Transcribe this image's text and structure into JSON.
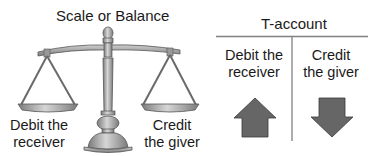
{
  "scale": {
    "title": "Scale or Balance",
    "left_label_line1": "Debit the",
    "left_label_line2": "receiver",
    "right_label_line1": "Credit",
    "right_label_line2": "the giver",
    "icon": "balance-scale-icon"
  },
  "t_account": {
    "title": "T-account",
    "left_label_line1": "Debit the",
    "left_label_line2": "receiver",
    "right_label_line1": "Credit",
    "right_label_line2": "the giver",
    "left_icon": "arrow-up-icon",
    "right_icon": "arrow-down-icon"
  },
  "colors": {
    "arrow_fill": "#666666",
    "arrow_stroke": "#3a3a3a",
    "line": "#808080",
    "scale_metal": "#9a9a9a"
  }
}
